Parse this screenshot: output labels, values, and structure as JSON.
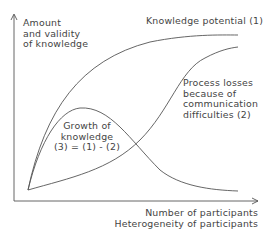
{
  "diagram": {
    "y_axis_label": [
      "Amount",
      "and validity",
      "of knowledge"
    ],
    "x_axis_label": [
      "Number of participants",
      "Heterogeneity of participants"
    ],
    "curves": {
      "potential": "Knowledge potential (1)",
      "losses": [
        "Process losses",
        "because of",
        "communication",
        "difficulties (2)"
      ],
      "growth": [
        "Growth of",
        "knowledge",
        "(3) = (1) - (2)"
      ]
    },
    "colors": {
      "line": "#555555",
      "text": "#444444",
      "background": "#ffffff"
    }
  }
}
